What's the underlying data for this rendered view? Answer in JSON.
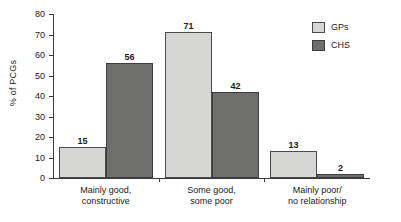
{
  "chart_data": {
    "type": "bar",
    "title": "",
    "xlabel": "",
    "ylabel": "% of PCGs",
    "ylim": [
      0,
      80
    ],
    "ytick_step": 10,
    "yticks": [
      "0",
      "10",
      "20",
      "30",
      "40",
      "50",
      "60",
      "70",
      "80"
    ],
    "grid": false,
    "legend_position": "top-right",
    "categories": [
      "Mainly good,\nconstructive",
      "Some good,\nsome poor",
      "Mainly poor/\nno relationship"
    ],
    "category_lines": [
      [
        "Mainly good,",
        "constructive"
      ],
      [
        "Some good,",
        "some poor"
      ],
      [
        "Mainly poor/",
        "no relationship"
      ]
    ],
    "series": [
      {
        "name": "GPs",
        "color": "#d6d6d4",
        "values": [
          15,
          71,
          13
        ]
      },
      {
        "name": "CHS",
        "color": "#6e6e6c",
        "values": [
          56,
          42,
          2
        ]
      }
    ]
  },
  "legend": {
    "items": [
      {
        "label": "GPs",
        "swatch": "gps"
      },
      {
        "label": "CHS",
        "swatch": "chs"
      }
    ]
  }
}
